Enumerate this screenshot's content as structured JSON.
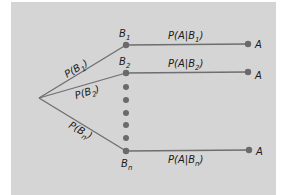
{
  "diagram": {
    "type": "probability-tree",
    "background_color": "#d5d5d5",
    "line_color": "#6e6e6e",
    "root": {
      "x": 39,
      "y": 98
    },
    "branches": [
      {
        "prob_label": "P(B",
        "prob_sub": "1",
        "prob_close": ")",
        "node_label": "B",
        "node_sub": "1",
        "cond_label": "P(A|B",
        "cond_sub": "1",
        "cond_close": ")",
        "outcome_label": "A"
      },
      {
        "prob_label": "P(B",
        "prob_sub": "2",
        "prob_close": ")",
        "node_label": "B",
        "node_sub": "2",
        "cond_label": "P(A|B",
        "cond_sub": "2",
        "cond_close": ")",
        "outcome_label": "A"
      },
      {
        "prob_label": "P(B",
        "prob_sub": "n",
        "prob_close": ")",
        "node_label": "B",
        "node_sub": "n",
        "cond_label": "P(A|B",
        "cond_sub": "n",
        "cond_close": ")",
        "outcome_label": "A"
      }
    ],
    "ellipsis_dots": 5
  }
}
